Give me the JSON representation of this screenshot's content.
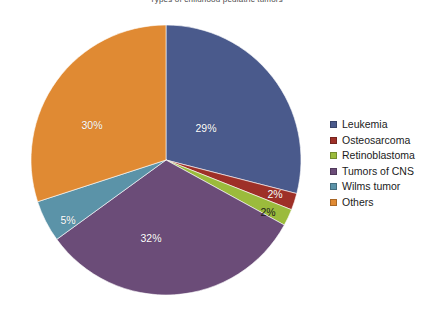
{
  "chart_data": {
    "type": "pie",
    "title": "Types of childhood pediatric tumors",
    "categories": [
      "Leukemia",
      "Osteosarcoma",
      "Retinoblastoma",
      "Tumors of CNS",
      "Wilms tumor",
      "Others"
    ],
    "values": [
      29,
      2,
      2,
      32,
      5,
      30
    ],
    "value_labels": [
      "29%",
      "2%",
      "2%",
      "32%",
      "5%",
      "30%"
    ],
    "colors": [
      "#4a5a8c",
      "#9e3028",
      "#9bbb3c",
      "#6b4c78",
      "#5b93a8",
      "#e08a33"
    ],
    "legend_position": "right",
    "grid": false,
    "xlabel": "",
    "ylabel": "",
    "units": "percent",
    "slices": [
      {
        "label": "Leukemia",
        "value": 29,
        "value_label": "29%",
        "color": "#4a5a8c",
        "label_color": "light",
        "label_x": 206,
        "label_y": 128
      },
      {
        "label": "Osteosarcoma",
        "value": 2,
        "value_label": "2%",
        "color": "#9e3028",
        "label_color": "light",
        "label_x": 275,
        "label_y": 194
      },
      {
        "label": "Retinoblastoma",
        "value": 2,
        "value_label": "2%",
        "color": "#9bbb3c",
        "label_color": "dark",
        "label_x": 268,
        "label_y": 212
      },
      {
        "label": "Tumors of CNS",
        "value": 32,
        "value_label": "32%",
        "color": "#6b4c78",
        "label_color": "light",
        "label_x": 151,
        "label_y": 238
      },
      {
        "label": "Wilms tumor",
        "value": 5,
        "value_label": "5%",
        "color": "#5b93a8",
        "label_color": "light",
        "label_x": 68,
        "label_y": 220
      },
      {
        "label": "Others",
        "value": 30,
        "value_label": "30%",
        "color": "#e08a33",
        "label_color": "light",
        "label_x": 92,
        "label_y": 125
      }
    ],
    "legend_entries": [
      {
        "label": "Leukemia",
        "color": "#4a5a8c"
      },
      {
        "label": "Osteosarcoma",
        "color": "#9e3028"
      },
      {
        "label": "Retinoblastoma",
        "color": "#9bbb3c"
      },
      {
        "label": "Tumors of CNS",
        "color": "#6b4c78"
      },
      {
        "label": "Wilms tumor",
        "color": "#5b93a8"
      },
      {
        "label": "Others",
        "color": "#e08a33"
      }
    ]
  }
}
